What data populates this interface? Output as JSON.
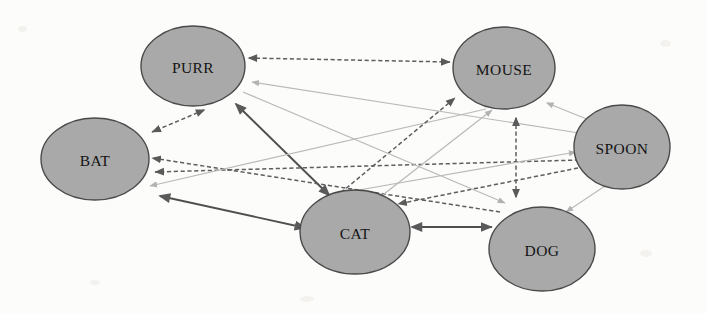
{
  "diagram": {
    "background_color": "#fcfcfb",
    "node_fill": "#a9a9a9",
    "node_stroke": "#4a4a4a",
    "edge_colors": {
      "dark_dashed": "#5e5e5e",
      "dark_solid": "#4f4f4f",
      "light_solid": "#b9b9b9"
    },
    "nodes": [
      {
        "id": "purr",
        "label": "PURR",
        "cx": 193,
        "cy": 66,
        "rx": 52,
        "ry": 40
      },
      {
        "id": "bat",
        "label": "BAT",
        "cx": 95,
        "cy": 159,
        "rx": 54,
        "ry": 41
      },
      {
        "id": "mouse",
        "label": "MOUSE",
        "cx": 504,
        "cy": 68,
        "rx": 51,
        "ry": 41
      },
      {
        "id": "spoon",
        "label": "SPOON",
        "cx": 622,
        "cy": 147,
        "rx": 48,
        "ry": 42
      },
      {
        "id": "cat",
        "label": "CAT",
        "cx": 355,
        "cy": 232,
        "rx": 55,
        "ry": 42
      },
      {
        "id": "dog",
        "label": "DOG",
        "cx": 542,
        "cy": 249,
        "rx": 53,
        "ry": 42
      }
    ],
    "edges": [
      {
        "id": "purr-mouse",
        "from": "purr",
        "to": "mouse",
        "style": "dark_dashed",
        "arrows": "both",
        "x1": 249,
        "y1": 58,
        "x2": 450,
        "y2": 62
      },
      {
        "id": "purr-bat",
        "from": "purr",
        "to": "bat",
        "style": "dark_dashed",
        "arrows": "both",
        "x1": 204,
        "y1": 110,
        "x2": 152,
        "y2": 132
      },
      {
        "id": "purr-cat",
        "from": "purr",
        "to": "cat",
        "style": "dark_solid",
        "arrows": "both",
        "x1": 236,
        "y1": 104,
        "x2": 330,
        "y2": 196
      },
      {
        "id": "purr-spoon",
        "from": "spoon",
        "to": "purr",
        "style": "light_solid",
        "arrows": "to-purr",
        "x1": 579,
        "y1": 133,
        "x2": 252,
        "y2": 82
      },
      {
        "id": "bat-cat",
        "from": "bat",
        "to": "cat",
        "style": "dark_solid",
        "arrows": "both",
        "x1": 160,
        "y1": 196,
        "x2": 306,
        "y2": 228
      },
      {
        "id": "bat-dog",
        "from": "dog",
        "to": "bat",
        "style": "dark_dashed",
        "arrows": "to-bat",
        "x1": 500,
        "y1": 212,
        "x2": 152,
        "y2": 158
      },
      {
        "id": "bat-spoon",
        "from": "spoon",
        "to": "bat",
        "style": "dark_dashed",
        "arrows": "to-bat",
        "x1": 579,
        "y1": 160,
        "x2": 155,
        "y2": 172
      },
      {
        "id": "bat-mouse",
        "from": "mouse",
        "to": "bat",
        "style": "light_solid",
        "arrows": "to-bat",
        "x1": 486,
        "y1": 109,
        "x2": 150,
        "y2": 186
      },
      {
        "id": "mouse-cat",
        "from": "cat",
        "to": "mouse",
        "style": "dark_dashed",
        "arrows": "to-mouse",
        "x1": 320,
        "y1": 210,
        "x2": 455,
        "y2": 98
      },
      {
        "id": "mouse-dog",
        "from": "mouse",
        "to": "dog",
        "style": "dark_dashed",
        "arrows": "both",
        "x1": 516,
        "y1": 118,
        "x2": 516,
        "y2": 198
      },
      {
        "id": "mouse-spoon",
        "from": "mouse",
        "to": "spoon",
        "style": "light_solid",
        "arrows": "both",
        "x1": 547,
        "y1": 103,
        "x2": 594,
        "y2": 122
      },
      {
        "id": "cat-dog",
        "from": "cat",
        "to": "dog",
        "style": "dark_solid",
        "arrows": "both",
        "x1": 412,
        "y1": 227,
        "x2": 492,
        "y2": 227
      },
      {
        "id": "cat-spoon",
        "from": "cat",
        "to": "spoon",
        "style": "light_solid",
        "arrows": "to-spoon",
        "x1": 336,
        "y1": 194,
        "x2": 576,
        "y2": 152
      },
      {
        "id": "dog-spoon",
        "from": "spoon",
        "to": "dog",
        "style": "light_solid",
        "arrows": "to-dog",
        "x1": 605,
        "y1": 186,
        "x2": 566,
        "y2": 212
      },
      {
        "id": "cat-mouse-2",
        "from": "cat",
        "to": "mouse",
        "style": "light_solid",
        "arrows": "to-mouse",
        "x1": 330,
        "y1": 236,
        "x2": 492,
        "y2": 110
      },
      {
        "id": "spoon-cat-2",
        "from": "spoon",
        "to": "cat",
        "style": "dark_dashed",
        "arrows": "to-cat",
        "x1": 578,
        "y1": 168,
        "x2": 398,
        "y2": 204
      },
      {
        "id": "purr-dog-2",
        "from": "purr",
        "to": "dog",
        "style": "light_solid",
        "arrows": "to-dog",
        "x1": 243,
        "y1": 92,
        "x2": 505,
        "y2": 203
      }
    ]
  }
}
